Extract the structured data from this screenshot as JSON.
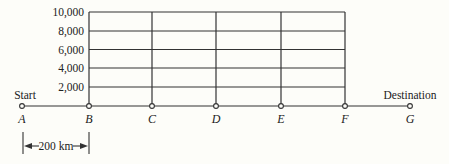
{
  "diagram": {
    "y_axis": {
      "ticks": [
        "10,000",
        "8,000",
        "6,000",
        "4,000",
        "2,000"
      ],
      "values": [
        10000,
        8000,
        6000,
        4000,
        2000
      ]
    },
    "points": [
      {
        "label": "A",
        "x": 22
      },
      {
        "label": "B",
        "x": 89
      },
      {
        "label": "C",
        "x": 152
      },
      {
        "label": "D",
        "x": 216
      },
      {
        "label": "E",
        "x": 281
      },
      {
        "label": "F",
        "x": 345
      },
      {
        "label": "G",
        "x": 410
      }
    ],
    "start_label": "Start",
    "destination_label": "Destination",
    "scale_label": "200 km",
    "colors": {
      "line": "#333333",
      "background": "#fdfdf9"
    }
  }
}
